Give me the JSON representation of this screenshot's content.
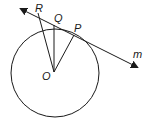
{
  "diagram": {
    "type": "geometry",
    "labels": {
      "R": "R",
      "Q": "Q",
      "P": "P",
      "O": "O",
      "m": "m"
    },
    "colors": {
      "stroke": "#1a1a1a",
      "background": "#ffffff"
    }
  }
}
